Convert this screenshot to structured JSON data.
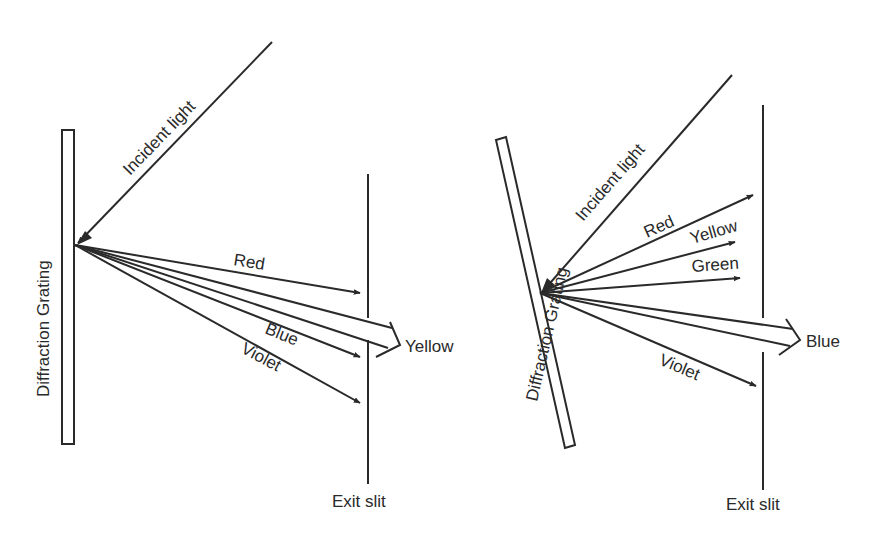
{
  "figure": {
    "left_panel": {
      "grating_label": "Diffraction Grating",
      "incident_label": "Incident light",
      "exit_label": "Exit slit",
      "rays": [
        {
          "label": "Red"
        },
        {
          "label": "Yellow",
          "passes_slit": true
        },
        {
          "label": "Blue"
        },
        {
          "label": "Violet"
        }
      ]
    },
    "right_panel": {
      "grating_label": "Diffraction Grating",
      "incident_label": "Incident light",
      "exit_label": "Exit slit",
      "rays": [
        {
          "label": "Red"
        },
        {
          "label": "Yellow"
        },
        {
          "label": "Green"
        },
        {
          "label": "Blue",
          "passes_slit": true
        },
        {
          "label": "Violet"
        }
      ]
    },
    "colors": {
      "ink": "#2a2a2a",
      "background": "#ffffff"
    }
  }
}
